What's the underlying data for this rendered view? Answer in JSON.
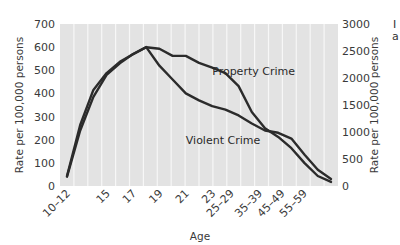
{
  "chart_data": {
    "type": "line",
    "title": "",
    "xlabel": "Age",
    "ylabel_left": "Rate per 100,000 persons",
    "ylabel_right": "Rate per 100,000 persons",
    "ylim_left": [
      0,
      700
    ],
    "ylim_right": [
      0,
      3000
    ],
    "yticks_left": [
      0,
      100,
      200,
      300,
      400,
      500,
      600,
      700
    ],
    "yticks_right": [
      0,
      500,
      1000,
      1500,
      2000,
      2500,
      3000
    ],
    "x_tick_labels": [
      "10–12",
      "15",
      "17",
      "19",
      "21",
      "23",
      "25–29",
      "35–39",
      "45–49",
      "55–59"
    ],
    "categories": [
      "10–12",
      "13",
      "14",
      "15",
      "16",
      "17",
      "18",
      "19",
      "20",
      "21",
      "22",
      "23",
      "24",
      "25–29",
      "30–34",
      "35–39",
      "40–44",
      "45–49",
      "50–54",
      "55–59",
      "60–64"
    ],
    "grid": {
      "vertical": true,
      "horizontal": false,
      "background": "#e3e3e3",
      "line_color": "#f7f7f7"
    },
    "legend": "inline labels",
    "series": [
      {
        "name": "Violent Crime",
        "axis": "left",
        "color": "#2b2b2b",
        "values": [
          40,
          240,
          385,
          480,
          530,
          570,
          600,
          520,
          460,
          400,
          370,
          345,
          330,
          305,
          270,
          240,
          230,
          205,
          135,
          70,
          30
        ]
      },
      {
        "name": "Property Crime",
        "axis": "right",
        "color": "#2b2b2b",
        "values": [
          185,
          1130,
          1780,
          2090,
          2300,
          2440,
          2570,
          2540,
          2410,
          2410,
          2280,
          2190,
          2090,
          1850,
          1370,
          1070,
          910,
          700,
          425,
          185,
          75
        ]
      }
    ],
    "annotations": [
      {
        "text": "Property Crime",
        "x_category": "23",
        "value_right": 2050
      },
      {
        "text": "Violent Crime",
        "x_category": "21",
        "value_left": 180
      }
    ]
  },
  "edge": {
    "cut_text_1": "I",
    "cut_text_2": "a"
  }
}
